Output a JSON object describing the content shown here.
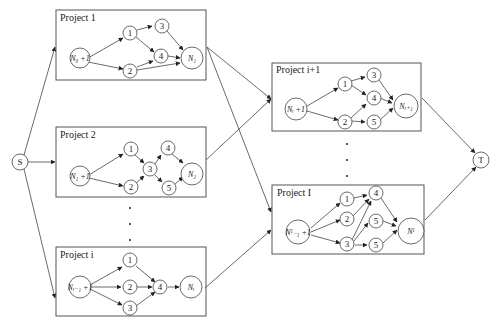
{
  "diagram": {
    "source": {
      "label": "S"
    },
    "sink": {
      "label": "T"
    },
    "projects": [
      {
        "title": "Project 1",
        "start_label": "N₀ +1",
        "end_label": "N₁",
        "nodes": [
          "1",
          "2",
          "3",
          "4"
        ]
      },
      {
        "title": "Project 2",
        "start_label": "N₁ +1",
        "end_label": "N₂",
        "nodes": [
          "1",
          "2",
          "3",
          "4",
          "5"
        ]
      },
      {
        "title": "Project i",
        "start_label": "Nᵢ₋₁ +1",
        "end_label": "Nᵢ",
        "nodes": [
          "1",
          "2",
          "3",
          "4"
        ]
      },
      {
        "title": "Project i+1",
        "start_label": "Nᵢ +1",
        "end_label": "Nᵢ₊₁",
        "nodes": [
          "1",
          "2",
          "3",
          "4",
          "5"
        ]
      },
      {
        "title": "Project I",
        "start_label": "Nᴵ₋₁ +1",
        "end_label": "Nᴵ",
        "nodes": [
          "1",
          "2",
          "3",
          "4",
          "5",
          "5"
        ]
      }
    ]
  }
}
